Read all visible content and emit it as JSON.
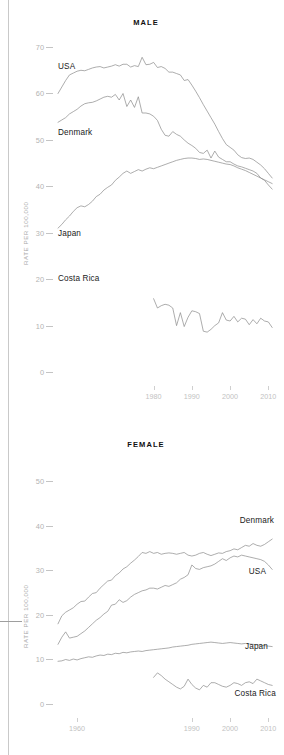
{
  "figure": {
    "y_axis_label": "RATE PER 100,000",
    "panels": [
      "MALE",
      "FEMALE"
    ]
  },
  "male_panel": {
    "title": "MALE",
    "y_axis_label": "RATE PER 100,000",
    "yticks": [
      "70",
      "60",
      "50",
      "40",
      "30",
      "20",
      "10",
      "0"
    ],
    "xticks": [
      "1980",
      "1990",
      "2000",
      "2010"
    ],
    "labels": {
      "usa": "USA",
      "denmark": "Denmark",
      "japan": "Japan",
      "costa_rica": "Costa Rica"
    }
  },
  "female_panel": {
    "title": "FEMALE",
    "y_axis_label": "RATE PER 100,000",
    "yticks": [
      "50",
      "40",
      "30",
      "20",
      "10",
      "0"
    ],
    "xticks": [
      "1960",
      "1990",
      "2000",
      "2010"
    ],
    "labels": {
      "denmark": "Denmark",
      "usa": "USA",
      "japan": "Japan",
      "costa_rica": "Costa Rica"
    }
  },
  "chart_data": [
    {
      "type": "line",
      "title": "MALE",
      "xlabel": "",
      "ylabel": "RATE PER 100,000",
      "xlim": [
        1955,
        2012
      ],
      "ylim": [
        0,
        72
      ],
      "xticks": [
        1980,
        1990,
        2000,
        2010
      ],
      "yticks": [
        0,
        10,
        20,
        30,
        40,
        50,
        60,
        70
      ],
      "grid": false,
      "legend": "inline-labels-left",
      "x": [
        1955,
        1956,
        1957,
        1958,
        1959,
        1960,
        1961,
        1962,
        1963,
        1964,
        1965,
        1966,
        1967,
        1968,
        1969,
        1970,
        1971,
        1972,
        1973,
        1974,
        1975,
        1976,
        1977,
        1978,
        1979,
        1980,
        1981,
        1982,
        1983,
        1984,
        1985,
        1986,
        1987,
        1988,
        1989,
        1990,
        1991,
        1992,
        1993,
        1994,
        1995,
        1996,
        1997,
        1998,
        1999,
        2000,
        2001,
        2002,
        2003,
        2004,
        2005,
        2006,
        2007,
        2008,
        2009,
        2010,
        2011
      ],
      "series": [
        {
          "name": "USA",
          "values": [
            60.2,
            61.6,
            63.0,
            64.2,
            64.6,
            65.0,
            65.2,
            65.1,
            65.4,
            65.7,
            65.9,
            66.0,
            65.7,
            65.9,
            66.1,
            66.4,
            66.1,
            66.5,
            66.5,
            65.9,
            66.2,
            66.0,
            68.0,
            66.4,
            66.5,
            66.9,
            65.8,
            66.0,
            65.6,
            64.8,
            64.8,
            64.5,
            64.2,
            63.0,
            63.2,
            62.0,
            60.7,
            59.3,
            57.8,
            56.4,
            55.0,
            53.6,
            52.0,
            50.5,
            49.2,
            48.6,
            48.0,
            47.0,
            46.4,
            46.2,
            46.3,
            46.0,
            45.4,
            44.8,
            44.0,
            43.0,
            42.0
          ]
        },
        {
          "name": "Denmark",
          "values": [
            54.0,
            54.5,
            55.0,
            55.8,
            56.3,
            56.8,
            57.5,
            58.0,
            58.2,
            58.3,
            58.6,
            59.0,
            59.4,
            59.6,
            59.4,
            60.0,
            58.8,
            60.2,
            57.4,
            58.8,
            57.2,
            59.5,
            56.0,
            56.0,
            55.8,
            55.3,
            54.4,
            52.5,
            51.2,
            51.0,
            52.0,
            51.4,
            51.0,
            50.2,
            49.5,
            49.0,
            48.4,
            47.5,
            47.3,
            48.0,
            46.3,
            47.8,
            46.5,
            46.0,
            45.5,
            45.5,
            45.0,
            44.6,
            44.4,
            44.1,
            43.8,
            43.5,
            43.0,
            42.0,
            41.5,
            40.5,
            39.6
          ]
        },
        {
          "name": "Japan",
          "values": [
            31.2,
            32.0,
            33.0,
            33.8,
            34.8,
            35.6,
            36.0,
            35.8,
            36.3,
            37.0,
            38.0,
            38.5,
            39.4,
            40.0,
            40.5,
            41.5,
            42.2,
            43.0,
            43.5,
            43.0,
            43.4,
            43.8,
            43.5,
            43.9,
            44.2,
            44.0,
            44.3,
            44.6,
            44.9,
            45.2,
            45.5,
            45.8,
            46.0,
            46.2,
            46.3,
            46.3,
            46.2,
            46.0,
            46.1,
            46.0,
            45.8,
            45.6,
            45.4,
            45.2,
            45.0,
            44.9,
            44.6,
            44.2,
            43.9,
            43.6,
            43.2,
            42.8,
            42.4,
            42.0,
            41.6,
            41.2,
            40.8
          ]
        },
        {
          "name": "Costa Rica",
          "values": [
            null,
            null,
            null,
            null,
            null,
            null,
            null,
            null,
            null,
            null,
            null,
            null,
            null,
            null,
            null,
            null,
            null,
            null,
            null,
            null,
            null,
            null,
            null,
            null,
            null,
            16.0,
            14.0,
            14.5,
            14.8,
            14.6,
            14.0,
            10.2,
            13.0,
            10.0,
            12.0,
            13.4,
            13.2,
            12.8,
            9.0,
            8.8,
            9.4,
            10.2,
            10.8,
            13.0,
            11.4,
            11.2,
            12.2,
            11.0,
            11.8,
            11.6,
            10.4,
            11.5,
            10.6,
            11.8,
            11.2,
            11.0,
            9.8
          ]
        }
      ]
    },
    {
      "type": "line",
      "title": "FEMALE",
      "xlabel": "",
      "ylabel": "RATE PER 100,000",
      "xlim": [
        1955,
        2012
      ],
      "ylim": [
        0,
        52
      ],
      "xticks": [
        1960,
        1990,
        2000,
        2010
      ],
      "yticks": [
        0,
        10,
        20,
        30,
        40,
        50
      ],
      "grid": false,
      "legend": "inline-labels-right",
      "x": [
        1955,
        1956,
        1957,
        1958,
        1959,
        1960,
        1961,
        1962,
        1963,
        1964,
        1965,
        1966,
        1967,
        1968,
        1969,
        1970,
        1971,
        1972,
        1973,
        1974,
        1975,
        1976,
        1977,
        1978,
        1979,
        1980,
        1981,
        1982,
        1983,
        1984,
        1985,
        1986,
        1987,
        1988,
        1989,
        1990,
        1991,
        1992,
        1993,
        1994,
        1995,
        1996,
        1997,
        1998,
        1999,
        2000,
        2001,
        2002,
        2003,
        2004,
        2005,
        2006,
        2007,
        2008,
        2009,
        2010,
        2011
      ],
      "series": [
        {
          "name": "Denmark",
          "values": [
            18.2,
            20.0,
            20.8,
            21.3,
            21.8,
            22.6,
            23.2,
            23.3,
            24.2,
            25.0,
            25.2,
            26.2,
            27.0,
            27.8,
            28.0,
            29.0,
            29.6,
            30.5,
            31.0,
            31.8,
            32.5,
            33.3,
            34.2,
            34.0,
            34.4,
            34.0,
            34.2,
            33.8,
            34.0,
            34.1,
            34.0,
            33.8,
            34.0,
            34.2,
            33.6,
            33.4,
            33.6,
            34.0,
            34.2,
            33.8,
            33.5,
            33.8,
            34.1,
            34.0,
            34.4,
            34.6,
            35.0,
            34.8,
            35.3,
            35.8,
            35.6,
            36.2,
            35.8,
            35.6,
            36.0,
            36.6,
            37.2
          ]
        },
        {
          "name": "USA",
          "values": [
            13.6,
            15.2,
            16.4,
            15.0,
            15.2,
            15.4,
            16.0,
            16.6,
            17.4,
            18.2,
            19.0,
            19.6,
            20.4,
            21.0,
            22.4,
            22.6,
            23.6,
            23.0,
            23.4,
            24.2,
            24.8,
            25.2,
            25.6,
            25.8,
            26.2,
            26.2,
            26.0,
            26.4,
            26.8,
            26.6,
            27.0,
            27.4,
            28.2,
            28.6,
            29.2,
            31.4,
            30.6,
            30.4,
            30.8,
            31.0,
            31.2,
            31.6,
            32.2,
            32.8,
            32.4,
            33.0,
            33.4,
            33.2,
            33.6,
            33.4,
            33.2,
            33.0,
            32.8,
            32.6,
            32.2,
            31.4,
            30.4
          ]
        },
        {
          "name": "Japan",
          "values": [
            9.8,
            9.9,
            10.2,
            10.0,
            10.3,
            10.1,
            10.4,
            10.6,
            10.8,
            10.7,
            11.0,
            11.2,
            11.1,
            11.4,
            11.3,
            11.6,
            11.5,
            11.8,
            11.7,
            11.9,
            12.0,
            12.1,
            12.0,
            12.2,
            12.3,
            12.4,
            12.5,
            12.6,
            12.7,
            12.8,
            13.0,
            13.1,
            13.2,
            13.3,
            13.4,
            13.6,
            13.7,
            13.8,
            13.9,
            14.0,
            14.1,
            14.0,
            13.9,
            13.8,
            13.9,
            14.0,
            13.9,
            13.8,
            13.7,
            13.8,
            13.7,
            13.6,
            13.5,
            13.4,
            13.3,
            13.2,
            13.1
          ]
        },
        {
          "name": "Costa Rica",
          "values": [
            null,
            null,
            null,
            null,
            null,
            null,
            null,
            null,
            null,
            null,
            null,
            null,
            null,
            null,
            null,
            null,
            null,
            null,
            null,
            null,
            null,
            null,
            null,
            null,
            null,
            6.2,
            7.2,
            6.6,
            5.8,
            5.2,
            4.6,
            4.0,
            3.6,
            4.2,
            5.8,
            4.6,
            3.8,
            3.4,
            4.4,
            4.0,
            5.0,
            5.0,
            4.6,
            4.2,
            4.0,
            4.4,
            5.0,
            4.8,
            4.4,
            5.0,
            5.2,
            4.8,
            5.8,
            5.4,
            5.0,
            4.6,
            4.4
          ]
        }
      ]
    }
  ]
}
